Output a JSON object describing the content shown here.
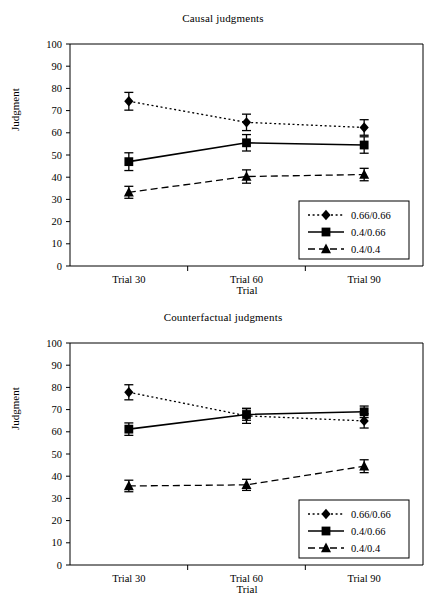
{
  "figure": {
    "panels": [
      "causal",
      "counterfactual"
    ],
    "background_color": "#ffffff",
    "ink_color": "#000000"
  },
  "causal": {
    "title": "Causal judgments",
    "ylabel": "Judgment",
    "xlabel": "Trial",
    "yticks": [
      "0",
      "10",
      "20",
      "30",
      "40",
      "50",
      "60",
      "70",
      "80",
      "90",
      "100"
    ],
    "categories": [
      "Trial 30",
      "Trial 60",
      "Trial 90"
    ],
    "legend": {
      "items": [
        {
          "label": "0.66/0.66",
          "marker": "diamond",
          "line": "dotted"
        },
        {
          "label": "0.4/0.66",
          "marker": "square",
          "line": "solid"
        },
        {
          "label": "0.4/0.4",
          "marker": "triangle",
          "line": "dashed"
        }
      ]
    }
  },
  "counterfactual": {
    "title": "Counterfactual judgments",
    "ylabel": "Judgment",
    "xlabel": "Trial",
    "yticks": [
      "0",
      "10",
      "20",
      "30",
      "40",
      "50",
      "60",
      "70",
      "80",
      "90",
      "100"
    ],
    "categories": [
      "Trial 30",
      "Trial 60",
      "Trial 90"
    ],
    "legend": {
      "items": [
        {
          "label": "0.66/0.66",
          "marker": "diamond",
          "line": "dotted"
        },
        {
          "label": "0.4/0.66",
          "marker": "square",
          "line": "solid"
        },
        {
          "label": "0.4/0.4",
          "marker": "triangle",
          "line": "dashed"
        }
      ]
    }
  },
  "chart_data": [
    {
      "type": "line",
      "id": "causal",
      "title": "Causal judgments",
      "xlabel": "Trial",
      "ylabel": "Judgment",
      "categories": [
        "Trial 30",
        "Trial 60",
        "Trial 90"
      ],
      "ylim": [
        0,
        100
      ],
      "ytick_step": 10,
      "grid": false,
      "legend_position": "lower-right-inside",
      "error_bars": "standard-error",
      "series": [
        {
          "name": "0.66/0.66",
          "marker": "diamond",
          "line": "dotted",
          "values": [
            74.2,
            64.7,
            62.4
          ],
          "errors": [
            4.0,
            3.7,
            3.5
          ]
        },
        {
          "name": "0.4/0.66",
          "marker": "square",
          "line": "solid",
          "values": [
            47.0,
            55.5,
            54.5
          ],
          "errors": [
            4.0,
            3.7,
            3.7
          ]
        },
        {
          "name": "0.4/0.4",
          "marker": "triangle",
          "line": "dashed",
          "values": [
            33.2,
            40.3,
            41.2
          ],
          "errors": [
            2.7,
            3.0,
            2.8
          ]
        }
      ]
    },
    {
      "type": "line",
      "id": "counterfactual",
      "title": "Counterfactual judgments",
      "xlabel": "Trial",
      "ylabel": "Judgment",
      "categories": [
        "Trial 30",
        "Trial 60",
        "Trial 90"
      ],
      "ylim": [
        0,
        100
      ],
      "ytick_step": 10,
      "grid": false,
      "legend_position": "lower-right-inside",
      "error_bars": "standard-error",
      "series": [
        {
          "name": "0.66/0.66",
          "marker": "diamond",
          "line": "dotted",
          "values": [
            77.8,
            67.2,
            64.9
          ],
          "errors": [
            3.4,
            3.4,
            3.2
          ]
        },
        {
          "name": "0.4/0.66",
          "marker": "square",
          "line": "solid",
          "values": [
            61.2,
            67.8,
            69.0
          ],
          "errors": [
            2.8,
            2.6,
            2.6
          ]
        },
        {
          "name": "0.4/0.4",
          "marker": "triangle",
          "line": "dashed",
          "values": [
            35.6,
            36.1,
            44.5
          ],
          "errors": [
            2.6,
            2.5,
            2.9
          ]
        }
      ]
    }
  ]
}
